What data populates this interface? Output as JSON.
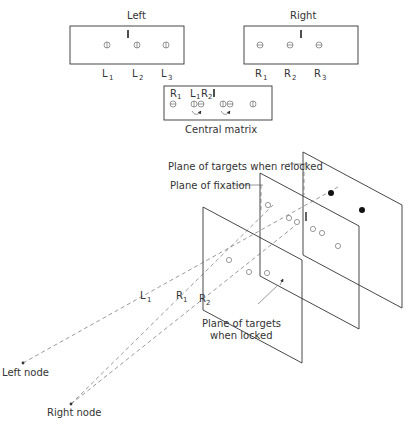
{
  "panels": {
    "left": {
      "title": "Left",
      "labels": [
        "L",
        "L",
        "L"
      ],
      "subs": [
        "1",
        "2",
        "3"
      ]
    },
    "right": {
      "title": "Right",
      "labels": [
        "R",
        "R",
        "R"
      ],
      "subs": [
        "1",
        "2",
        "3"
      ]
    },
    "central": {
      "caption": "Central matrix",
      "top_labels": [
        {
          "t": "R",
          "s": "1"
        },
        {
          "t": "L",
          "s": "1"
        },
        {
          "t": "R",
          "s": "2"
        }
      ]
    }
  },
  "diagram3d": {
    "labels": {
      "relocked": "Plane of targets when relocked",
      "fixation": "Plane of fixation",
      "locked_line1": "Plane of targets",
      "locked_line2": "when locked",
      "left_node": "Left node",
      "right_node": "Right node"
    },
    "ray_labels": [
      {
        "t": "L",
        "s": "1"
      },
      {
        "t": "R",
        "s": "1"
      },
      {
        "t": "R",
        "s": "2"
      }
    ]
  }
}
